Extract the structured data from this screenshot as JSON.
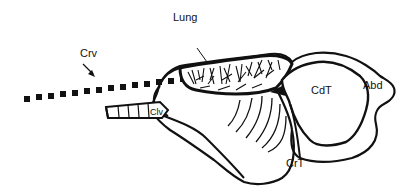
{
  "diagram": {
    "labels": {
      "crv": "Crv",
      "lung": "Lung",
      "clv": "Clv",
      "cdt": "CdT",
      "abd": "Abd",
      "crt": "CrT"
    },
    "colors": {
      "ink": "#111111",
      "background": "#ffffff"
    }
  }
}
